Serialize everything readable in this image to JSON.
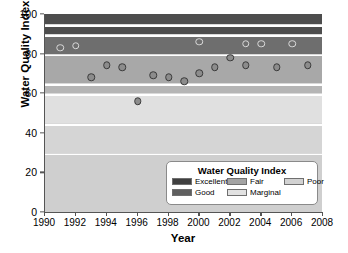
{
  "chart_data": {
    "type": "scatter",
    "title": "",
    "xlabel": "Year",
    "ylabel": "Water Quality Index",
    "xlim": [
      1990,
      2008
    ],
    "ylim": [
      0,
      100
    ],
    "xticks": [
      1990,
      1992,
      1994,
      1996,
      1998,
      2000,
      2002,
      2004,
      2006,
      2008
    ],
    "yticks": [
      0,
      20,
      40,
      60,
      80,
      100
    ],
    "grid": false,
    "legend_position": "inside-bottom-right",
    "series": [
      {
        "name": "Excellent range observations",
        "marker": "open-circle",
        "x": [
          1991,
          1992,
          2000,
          2003,
          2004,
          2006
        ],
        "y": [
          83,
          84,
          86,
          85,
          85,
          85
        ]
      },
      {
        "name": "Good range observations",
        "marker": "filled-circle",
        "x": [
          1993,
          1994,
          1995,
          1997,
          1998,
          1999,
          2000,
          2001,
          2002,
          2003,
          2005,
          2007
        ],
        "y": [
          68,
          74,
          73,
          69,
          68,
          66,
          70,
          73,
          78,
          74,
          73,
          74
        ]
      },
      {
        "name": "Marginal range observation",
        "marker": "filled-circle",
        "x": [
          1996
        ],
        "y": [
          56
        ]
      }
    ],
    "bands": [
      {
        "label": "Excellent",
        "range": [
          95,
          100
        ],
        "color": "#4d4d4d"
      },
      {
        "label": "Excellent",
        "range": [
          90,
          94
        ],
        "color": "#4d4d4d"
      },
      {
        "label": "Good",
        "range": [
          80,
          89
        ],
        "color": "#6e6e6e"
      },
      {
        "label": "Fair",
        "range": [
          65,
          79
        ],
        "color": "#a8a8a8"
      },
      {
        "label": "Fair",
        "range": [
          60,
          64
        ],
        "color": "#b5b5b5"
      },
      {
        "label": "Marginal",
        "range": [
          45,
          59
        ],
        "color": "#e0e0e0"
      },
      {
        "label": "Marginal",
        "range": [
          30,
          44
        ],
        "color": "#d5d5d5"
      },
      {
        "label": "Poor",
        "range": [
          0,
          29
        ],
        "color": "#cfcfcf"
      }
    ]
  },
  "axes": {
    "y_title": "Water Quality Index",
    "x_title": "Year",
    "y_tick_labels": [
      "0",
      "20",
      "40",
      "60",
      "80",
      "100"
    ],
    "x_tick_labels": [
      "1990",
      "1992",
      "1994",
      "1996",
      "1998",
      "2000",
      "2002",
      "2004",
      "2006",
      "2008"
    ]
  },
  "legend": {
    "title": "Water Quality Index",
    "items": [
      {
        "label": "Excellent",
        "color": "#3f3f3f"
      },
      {
        "label": "Good",
        "color": "#5f5f5f"
      },
      {
        "label": "Fair",
        "color": "#a3a3a3"
      },
      {
        "label": "Marginal",
        "color": "#e2e2e2"
      },
      {
        "label": "Poor",
        "color": "#d2d2d2"
      }
    ]
  },
  "colors": {
    "marker_fill": "#8c8c8c",
    "marker_edge": "#3a3a3a",
    "open_marker_edge": "#d8d8d8",
    "axis": "#555555",
    "separator": "#ffffff"
  }
}
